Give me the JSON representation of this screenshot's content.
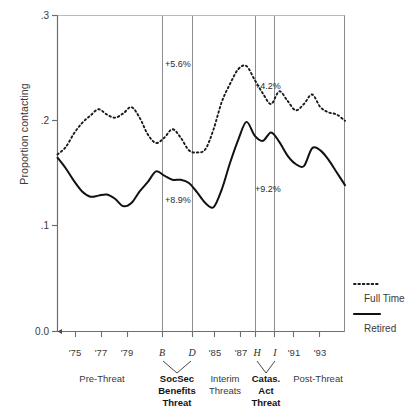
{
  "chart_data": {
    "type": "line",
    "title": "",
    "xlabel": "",
    "ylabel": "Proportion contacting",
    "ylim": [
      0.0,
      0.3
    ],
    "yticks": [
      "0.0",
      ".1",
      ".2",
      ".3"
    ],
    "ytick_values": [
      0.0,
      0.1,
      0.2,
      0.3
    ],
    "grid": false,
    "legend_position": "right",
    "x_tick_labels": [
      "'75",
      "'77",
      "'79",
      "B",
      "D",
      "'85",
      "'87",
      "H",
      "I",
      "'91",
      "'93"
    ],
    "x_tick_italic": [
      false,
      false,
      false,
      true,
      true,
      false,
      false,
      true,
      true,
      false,
      false
    ],
    "series": [
      {
        "name": "Full Time",
        "style": "dotted",
        "color": "#1a1a1a",
        "x": [
          1973.6,
          1974.2,
          1974.8,
          1975.4,
          1976.0,
          1976.6,
          1977.2,
          1977.8,
          1978.4,
          1979.0,
          1979.6,
          1980.2,
          1980.8,
          1981.4,
          1982.0,
          1982.6,
          1983.2,
          1983.8,
          1984.4,
          1985.0,
          1985.6,
          1986.2,
          1986.8,
          1987.4,
          1988.0,
          1988.6,
          1989.2,
          1989.8,
          1990.4,
          1991.0,
          1991.6,
          1992.2,
          1992.8,
          1993.4,
          1994.0,
          1994.6
        ],
        "values": [
          0.168,
          0.175,
          0.188,
          0.198,
          0.205,
          0.211,
          0.206,
          0.203,
          0.207,
          0.213,
          0.203,
          0.187,
          0.179,
          0.184,
          0.192,
          0.184,
          0.172,
          0.17,
          0.173,
          0.192,
          0.218,
          0.235,
          0.249,
          0.252,
          0.239,
          0.226,
          0.216,
          0.228,
          0.219,
          0.21,
          0.216,
          0.225,
          0.213,
          0.208,
          0.206,
          0.2
        ]
      },
      {
        "name": "Retired",
        "style": "solid",
        "color": "#111111",
        "x": [
          1973.6,
          1974.2,
          1974.8,
          1975.4,
          1976.0,
          1976.6,
          1977.2,
          1977.8,
          1978.4,
          1979.0,
          1979.6,
          1980.2,
          1980.8,
          1981.4,
          1982.0,
          1982.6,
          1983.2,
          1983.8,
          1984.4,
          1985.0,
          1985.6,
          1986.2,
          1986.8,
          1987.4,
          1988.0,
          1988.6,
          1989.2,
          1989.8,
          1990.4,
          1991.0,
          1991.6,
          1992.2,
          1992.8,
          1993.4,
          1994.0,
          1994.6
        ],
        "values": [
          0.165,
          0.155,
          0.143,
          0.133,
          0.128,
          0.129,
          0.13,
          0.126,
          0.119,
          0.122,
          0.133,
          0.142,
          0.152,
          0.148,
          0.144,
          0.144,
          0.141,
          0.132,
          0.122,
          0.118,
          0.135,
          0.16,
          0.182,
          0.199,
          0.186,
          0.181,
          0.189,
          0.18,
          0.167,
          0.159,
          0.157,
          0.174,
          0.172,
          0.163,
          0.151,
          0.139
        ]
      }
    ],
    "vertical_markers": [
      {
        "label": "B",
        "year": 1981.4
      },
      {
        "label": "D",
        "year": 1983.0
      },
      {
        "label": "H",
        "year": 1986.6
      },
      {
        "label": "I",
        "year": 1987.6
      }
    ],
    "annotations": [
      {
        "text": "+5.6%",
        "series": "Full Time",
        "note": "SocSec Benefits Threat increase, full time"
      },
      {
        "text": "+8.9%",
        "series": "Retired",
        "note": "SocSec Benefits Threat increase, retired"
      },
      {
        "text": "+4.2%",
        "series": "Full Time",
        "note": "Catas. Act Threat increase, full time"
      },
      {
        "text": "+9.2%",
        "series": "Retired",
        "note": "Catas. Act Threat increase, retired"
      }
    ],
    "period_labels": [
      {
        "lines": [
          "Pre-Threat"
        ],
        "bold": false
      },
      {
        "lines": [
          "SocSec",
          "Benefits",
          "Threat"
        ],
        "bold": true
      },
      {
        "lines": [
          "Interim",
          "Threats"
        ],
        "bold": false
      },
      {
        "lines": [
          "Catas.",
          "Act",
          "Threat"
        ],
        "bold": true
      },
      {
        "lines": [
          "Post-Threat"
        ],
        "bold": false
      }
    ],
    "legend": [
      {
        "label": "Full Time",
        "style": "dotted"
      },
      {
        "label": "Retired",
        "style": "solid"
      }
    ]
  }
}
